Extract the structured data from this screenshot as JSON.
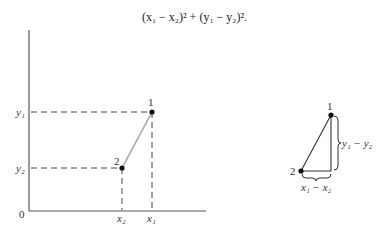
{
  "formula": {
    "text": "(x₁ − x₂)² + (y₁ − y₂)²."
  },
  "left_diagram": {
    "origin_label": "0",
    "y_labels": {
      "y1": "y₁",
      "y2": "y₂"
    },
    "x_labels": {
      "x1": "x₁",
      "x2": "x₂"
    },
    "points": [
      {
        "label": "1",
        "x": "x₁",
        "y": "y₁"
      },
      {
        "label": "2",
        "x": "x₂",
        "y": "y₂"
      }
    ],
    "segment_color": "#b0b0b0",
    "axis_color": "#555555"
  },
  "right_diagram": {
    "vertex_labels": {
      "top": "1",
      "bottom_left": "2"
    },
    "vertical_leg_label": "y₁ − y₂",
    "horizontal_leg_label": "x₁ − x₂"
  }
}
